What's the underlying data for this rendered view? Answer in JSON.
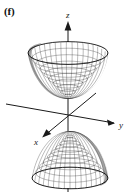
{
  "figure": {
    "panel_label": "(f)",
    "caption_text": "",
    "background_color": "#ffffff",
    "ink_color": "#1a1a1a",
    "mesh_color": "#2b2b2b",
    "width_px": 129,
    "height_px": 194
  },
  "axes": {
    "z": {
      "label": "z",
      "direction": "up",
      "arrow": "up-arrow-head",
      "label_x": 69,
      "label_y": 17,
      "start_x": 68,
      "start_y": 192,
      "end_x": 68,
      "end_y": 22
    },
    "y": {
      "label": "y",
      "direction": "right-down",
      "arrow": "right-arrow-head",
      "label_x": 120,
      "label_y": 127,
      "start_x": 6,
      "start_y": 104,
      "end_x": 116,
      "end_y": 123
    },
    "x": {
      "label": "x",
      "direction": "left-down",
      "arrow": "lower-left-arrow-head",
      "label_x": 36,
      "label_y": 144,
      "start_x": 96,
      "start_y": 93,
      "end_x": 42,
      "end_y": 137
    }
  },
  "surface": {
    "name": "hyperboloid-of-two-sheets",
    "rendering": "wireframe-mesh",
    "sheets": [
      {
        "name": "upper-sheet",
        "shape": "upward-opening-bowl",
        "vertex_z": "above origin",
        "rim_center_x": 68,
        "rim_center_y": 53,
        "rim_rx": 40,
        "rim_ry": 12,
        "apex_x": 68,
        "apex_y": 99
      },
      {
        "name": "lower-sheet",
        "shape": "downward-opening-dome",
        "vertex_z": "below origin",
        "rim_center_x": 70,
        "rim_center_y": 178,
        "rim_rx": 38,
        "rim_ry": 11,
        "apex_x": 70,
        "apex_y": 131
      }
    ],
    "mesh_u_lines": 28,
    "mesh_v_lines": 10
  }
}
